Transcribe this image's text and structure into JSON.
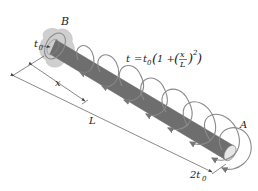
{
  "figure": {
    "type": "mechanics-diagram",
    "labels": {
      "fixed_end": "B",
      "free_end": "A",
      "torque_at_B": "t",
      "torque_at_B_sub": "0",
      "torque_at_A_coef": "2t",
      "torque_at_A_sub": "0",
      "position": "x",
      "length": "L"
    },
    "equation": {
      "lhs": "t",
      "eq": "=",
      "t0": "t",
      "t0_sub": "0",
      "open": "(1 + (",
      "num": "x",
      "den": "L",
      "close": ")",
      "exp": "2",
      "tail": ")"
    },
    "colors": {
      "rod_light": "#d9d9d9",
      "rod_dark": "#7a7a7a",
      "coil": "#8a8a8a",
      "wall": "#c8c8c8",
      "dimension_line": "#555555"
    },
    "coil_count": 8
  }
}
